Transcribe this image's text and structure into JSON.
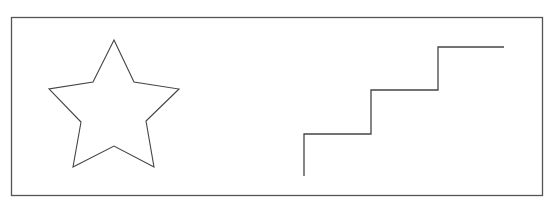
{
  "canvas": {
    "width": 552,
    "height": 207,
    "background": "#ffffff"
  },
  "frame": {
    "x": 11,
    "y": 17,
    "width": 531,
    "height": 178,
    "stroke": "#555555"
  },
  "shapes": {
    "star": {
      "label": "star",
      "stroke": "#444444",
      "points": "114,40 134,82 179,89 146,121 154,167 114,146 73,167 81,122 49,89 93,82"
    },
    "staircase": {
      "label": "staircase",
      "stroke": "#444444",
      "points": "304,176 304,134 371,134 371,90 438,90 438,47 504,47"
    }
  }
}
